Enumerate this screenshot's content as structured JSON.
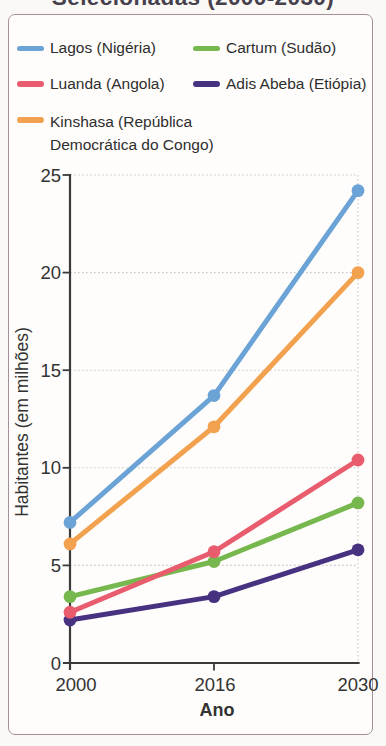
{
  "header": {
    "title": "Selecionadas (2000-2030)"
  },
  "legend": {
    "items": [
      {
        "label": "Lagos (Nigéria)",
        "color": "#6ba3d6"
      },
      {
        "label": "Cartum (Sudão)",
        "color": "#77b84e"
      },
      {
        "label": "Luanda (Angola)",
        "color": "#e85c6e"
      },
      {
        "label": "Adis Abeba (Etiópia)",
        "color": "#473282"
      },
      {
        "label": "Kinshasa (República Democrática do Congo)",
        "color": "#f2a14f"
      }
    ]
  },
  "chart_data": {
    "type": "line",
    "x": [
      2000,
      2016,
      2030
    ],
    "x_tick_labels": [
      "2000",
      "2016",
      "2030"
    ],
    "series": [
      {
        "name": "Cartum (Sudão)",
        "color": "#77b84e",
        "values": [
          3.4,
          5.2,
          8.2
        ]
      },
      {
        "name": "Adis Abeba (Etiópia)",
        "color": "#473282",
        "values": [
          2.2,
          3.4,
          5.8
        ]
      },
      {
        "name": "Luanda (Angola)",
        "color": "#e85c6e",
        "values": [
          2.6,
          5.7,
          10.4
        ]
      },
      {
        "name": "Kinshasa (República Democrática do Congo)",
        "color": "#f2a14f",
        "values": [
          6.1,
          12.1,
          20.0
        ]
      },
      {
        "name": "Lagos (Nigéria)",
        "color": "#6ba3d6",
        "values": [
          7.2,
          13.7,
          24.2
        ]
      }
    ],
    "xlabel": "Ano",
    "ylabel": "Habitantes (em milhões)",
    "ylim": [
      0,
      25
    ],
    "y_ticks": [
      0,
      5,
      10,
      15,
      20,
      25
    ],
    "grid": true,
    "legend_position": "top",
    "marker": "circle"
  },
  "colors": {
    "axis": "#3a3a3a",
    "grid": "#c9c9c9",
    "text": "#333333",
    "card_border": "#a5909a",
    "background": "#faf9f6"
  }
}
